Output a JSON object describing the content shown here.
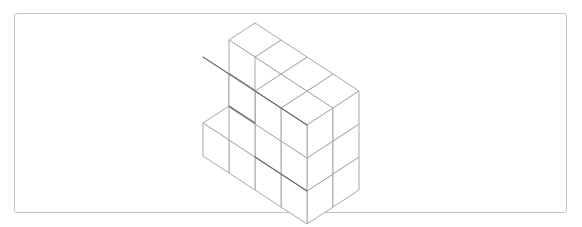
{
  "figure": {
    "kind": "isometric-cube-stack",
    "caption": "",
    "frame": {
      "border_color": "#c4c4c4",
      "fill_color": "#ffffff",
      "corner_radius": 3,
      "x": 14,
      "y": 13,
      "width": 553,
      "height": 200
    },
    "line_colors": {
      "primary_edge": "#6a6a6a",
      "standard_edge": "#a8a8a8",
      "light_edge": "#c9c9c9"
    },
    "projection": {
      "type": "isometric",
      "origin_x": 203,
      "origin_y": 156,
      "cube_edge_px": 33,
      "axis_x_dx": 26,
      "axis_x_dy": 17,
      "axis_y_dx": 26,
      "axis_y_dy": -17,
      "axis_z_dx": 0,
      "axis_z_dy": -33
    },
    "grid": {
      "columns_x": 4,
      "rows_y": 2,
      "levels_z": 3
    },
    "cube_count_visible": 22,
    "cells": [
      {
        "x": 0,
        "y": 0,
        "z": 0
      },
      {
        "x": 0,
        "y": 1,
        "z": 0
      },
      {
        "x": 1,
        "y": 0,
        "z": 0
      },
      {
        "x": 1,
        "y": 1,
        "z": 0
      },
      {
        "x": 2,
        "y": 1,
        "z": 0
      },
      {
        "x": 3,
        "y": 0,
        "z": 0
      },
      {
        "x": 3,
        "y": 1,
        "z": 0
      },
      {
        "x": 0,
        "y": 1,
        "z": 1
      },
      {
        "x": 1,
        "y": 0,
        "z": 1
      },
      {
        "x": 1,
        "y": 1,
        "z": 1
      },
      {
        "x": 2,
        "y": 0,
        "z": 1
      },
      {
        "x": 2,
        "y": 1,
        "z": 1
      },
      {
        "x": 3,
        "y": 0,
        "z": 1
      },
      {
        "x": 3,
        "y": 1,
        "z": 1
      },
      {
        "x": 0,
        "y": 1,
        "z": 2
      },
      {
        "x": 1,
        "y": 0,
        "z": 2
      },
      {
        "x": 1,
        "y": 1,
        "z": 2
      },
      {
        "x": 2,
        "y": 0,
        "z": 2
      },
      {
        "x": 2,
        "y": 1,
        "z": 2
      },
      {
        "x": 3,
        "y": 0,
        "z": 2
      },
      {
        "x": 3,
        "y": 1,
        "z": 2
      },
      {
        "x": 2,
        "y": 0,
        "z": 0
      }
    ]
  }
}
